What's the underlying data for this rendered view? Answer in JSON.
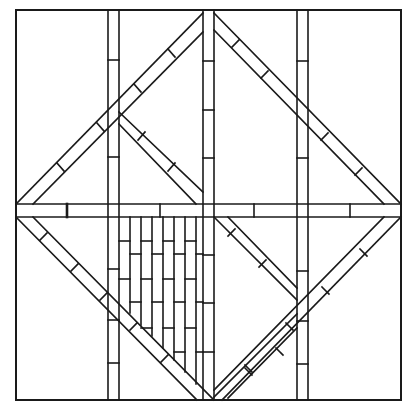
{
  "diagram": {
    "type": "line-art pattern",
    "colors": {
      "line": "#1a1a1a",
      "background": "#ffffff"
    },
    "frame": {
      "x1": 16,
      "y1": 10,
      "x2": 401,
      "y2": 400
    },
    "vertical_strips": [
      {
        "x1": 108,
        "x2": 119
      },
      {
        "x1": 203,
        "x2": 214
      },
      {
        "x1": 297,
        "x2": 308
      }
    ],
    "horizontal_band": {
      "y1": 204,
      "y2": 217
    },
    "brick_infill_region": "lower-left triangle between left strip and center strip"
  },
  "caption": {
    "text": ""
  }
}
